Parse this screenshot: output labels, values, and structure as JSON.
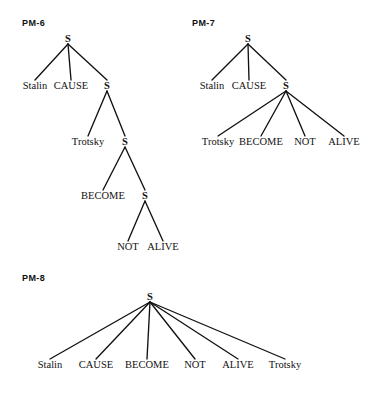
{
  "figure": {
    "background_color": "#ffffff",
    "ink_color": "#111111"
  },
  "chart_data": {
    "type": "diagram",
    "subtype": "syntactic-tree",
    "trees": [
      {
        "id": "PM-6",
        "label": "PM-6",
        "label_pos": [
          22,
          26
        ],
        "root": "S",
        "structure": "[S Stalin CAUSE [S Trotsky [S BECOME [S NOT ALIVE]]]]",
        "nodes": [
          {
            "name": "S",
            "kind": "nonterminal",
            "x": 68,
            "y": 42
          },
          {
            "name": "Stalin",
            "kind": "leaf",
            "x": 35,
            "y": 89
          },
          {
            "name": "CAUSE",
            "kind": "leaf",
            "x": 71,
            "y": 89
          },
          {
            "name": "S",
            "kind": "nonterminal",
            "x": 107,
            "y": 89
          },
          {
            "name": "Trotsky",
            "kind": "leaf",
            "x": 88,
            "y": 145
          },
          {
            "name": "S",
            "kind": "nonterminal",
            "x": 125,
            "y": 145
          },
          {
            "name": "BECOME",
            "kind": "leaf",
            "x": 103,
            "y": 199
          },
          {
            "name": "S",
            "kind": "nonterminal",
            "x": 145,
            "y": 199
          },
          {
            "name": "NOT",
            "kind": "leaf",
            "x": 128,
            "y": 250
          },
          {
            "name": "ALIVE",
            "kind": "leaf",
            "x": 163,
            "y": 250
          }
        ],
        "edges": [
          [
            0,
            1
          ],
          [
            0,
            2
          ],
          [
            0,
            3
          ],
          [
            3,
            4
          ],
          [
            3,
            5
          ],
          [
            5,
            6
          ],
          [
            5,
            7
          ],
          [
            7,
            8
          ],
          [
            7,
            9
          ]
        ]
      },
      {
        "id": "PM-7",
        "label": "PM-7",
        "label_pos": [
          192,
          26
        ],
        "root": "S",
        "structure": "[S Stalin CAUSE [S Trotsky BECOME NOT ALIVE]]",
        "nodes": [
          {
            "name": "S",
            "kind": "nonterminal",
            "x": 248,
            "y": 42
          },
          {
            "name": "Stalin",
            "kind": "leaf",
            "x": 212,
            "y": 89
          },
          {
            "name": "CAUSE",
            "kind": "leaf",
            "x": 249,
            "y": 89
          },
          {
            "name": "S",
            "kind": "nonterminal",
            "x": 286,
            "y": 89
          },
          {
            "name": "Trotsky",
            "kind": "leaf",
            "x": 218,
            "y": 145
          },
          {
            "name": "BECOME",
            "kind": "leaf",
            "x": 261,
            "y": 145
          },
          {
            "name": "NOT",
            "kind": "leaf",
            "x": 305,
            "y": 145
          },
          {
            "name": "ALIVE",
            "kind": "leaf",
            "x": 344,
            "y": 145
          }
        ],
        "edges": [
          [
            0,
            1
          ],
          [
            0,
            2
          ],
          [
            0,
            3
          ],
          [
            3,
            4
          ],
          [
            3,
            5
          ],
          [
            3,
            6
          ],
          [
            3,
            7
          ]
        ]
      },
      {
        "id": "PM-8",
        "label": "PM-8",
        "label_pos": [
          22,
          281
        ],
        "root": "S",
        "structure": "[S Stalin CAUSE BECOME NOT ALIVE Trotsky]",
        "nodes": [
          {
            "name": "S",
            "kind": "nonterminal",
            "x": 150,
            "y": 300
          },
          {
            "name": "Stalin",
            "kind": "leaf",
            "x": 50,
            "y": 368
          },
          {
            "name": "CAUSE",
            "kind": "leaf",
            "x": 96,
            "y": 368
          },
          {
            "name": "BECOME",
            "kind": "leaf",
            "x": 147,
            "y": 368
          },
          {
            "name": "NOT",
            "kind": "leaf",
            "x": 195,
            "y": 368
          },
          {
            "name": "ALIVE",
            "kind": "leaf",
            "x": 238,
            "y": 368
          },
          {
            "name": "Trotsky",
            "kind": "leaf",
            "x": 285,
            "y": 368
          }
        ],
        "edges": [
          [
            0,
            1
          ],
          [
            0,
            2
          ],
          [
            0,
            3
          ],
          [
            0,
            4
          ],
          [
            0,
            5
          ],
          [
            0,
            6
          ]
        ]
      }
    ],
    "lexical_items": [
      "Stalin",
      "CAUSE",
      "BECOME",
      "NOT",
      "ALIVE",
      "Trotsky"
    ],
    "nonterminal_symbol": "S"
  }
}
